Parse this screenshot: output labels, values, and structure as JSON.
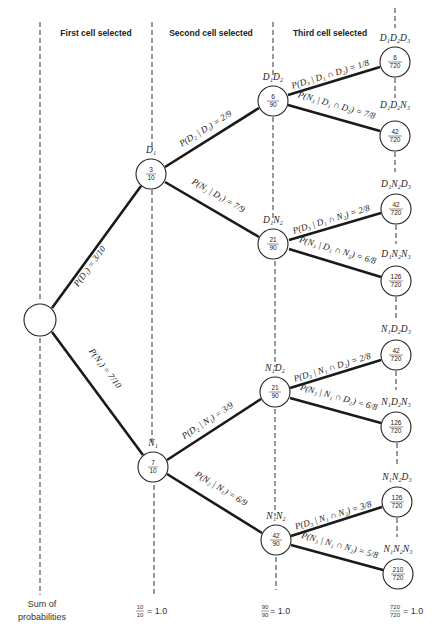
{
  "headers": {
    "first": "First cell selected",
    "second": "Second cell selected",
    "third": "Third cell selected"
  },
  "root": {
    "label": "",
    "value": ""
  },
  "level1": [
    {
      "label": "D₁",
      "num": "3",
      "den": "10",
      "edge": "P(D₁) = 3/10"
    },
    {
      "label": "N₁",
      "num": "7",
      "den": "10",
      "edge": "P(N₁) = 7/10"
    }
  ],
  "level2": [
    {
      "label": "D₁D₂",
      "num": "6",
      "den": "90",
      "edge": "P(D₂ | D₁) = 2/9"
    },
    {
      "label": "D₁N₂",
      "num": "21",
      "den": "90",
      "edge": "P(N₂ | D₁) = 7/9"
    },
    {
      "label": "N₁D₂",
      "num": "21",
      "den": "90",
      "edge": "P(D₂ | N₁) = 3/9"
    },
    {
      "label": "N₁N₂",
      "num": "42",
      "den": "90",
      "edge": "P(N₂ | N₁) = 6/9"
    }
  ],
  "level3": [
    {
      "label": "D₁D₂D₃",
      "num": "6",
      "den": "720",
      "edge": "P(D₃ | D₁ ∩ D₂) = 1/8"
    },
    {
      "label": "D₁D₂N₃",
      "num": "42",
      "den": "720",
      "edge": "P(N₃ | D₁ ∩ D₂) = 7/8"
    },
    {
      "label": "D₁N₂D₃",
      "num": "42",
      "den": "720",
      "edge": "P(D₃ | D₁ ∩ N₂) = 2/8"
    },
    {
      "label": "D₁N₂N₃",
      "num": "126",
      "den": "720",
      "edge": "P(N₃ | D₁ ∩ N₂) = 6/8"
    },
    {
      "label": "N₁D₂D₃",
      "num": "42",
      "den": "720",
      "edge": "P(D₃ | N₁ ∩ D₂) = 2/8"
    },
    {
      "label": "N₁D₂N₃",
      "num": "126",
      "den": "720",
      "edge": "P(N₃ | N₁ ∩ D₂) = 6/8"
    },
    {
      "label": "N₁N₂D₃",
      "num": "126",
      "den": "720",
      "edge": "P(D₃ | N₁ ∩ N₂) = 3/8"
    },
    {
      "label": "N₁N₂N₃",
      "num": "210",
      "den": "720",
      "edge": "P(N₃ | N₁ ∩ N₂) = 5/8"
    }
  ],
  "footer": {
    "label_line1": "Sum of",
    "label_line2": "probabilities",
    "sum1_num": "10",
    "sum1_den": "10",
    "sum1_eq": "= 1.0",
    "sum2_num": "90",
    "sum2_den": "90",
    "sum2_eq": "= 1.0",
    "sum3_num": "720",
    "sum3_den": "720",
    "sum3_eq": "= 1.0"
  }
}
